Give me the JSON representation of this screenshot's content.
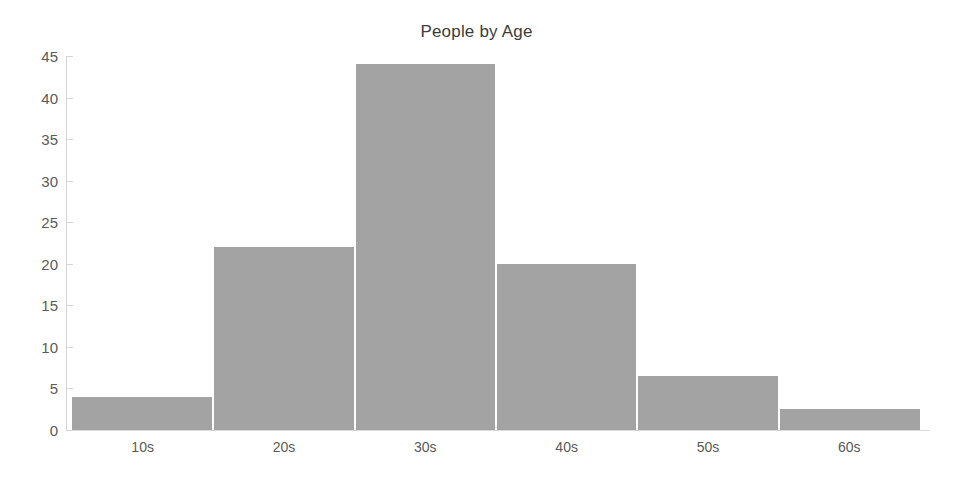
{
  "chart_data": {
    "type": "bar",
    "title": "People by Age",
    "xlabel": "",
    "ylabel": "",
    "categories": [
      "10s",
      "20s",
      "30s",
      "40s",
      "50s",
      "60s"
    ],
    "values": [
      4,
      22,
      44,
      20,
      6.5,
      2.5
    ],
    "ylim": [
      0,
      45
    ],
    "yticks": [
      0,
      5,
      10,
      15,
      20,
      25,
      30,
      35,
      40,
      45
    ],
    "ytick_labels": [
      "0",
      "5",
      "10",
      "15",
      "20",
      "25",
      "30",
      "35",
      "40",
      "45"
    ],
    "grid": false,
    "legend": null,
    "bar_color": "#a3a3a3",
    "bar_gap": "contiguous-histogram",
    "axis_color": "#d6d6d6",
    "text_color": "#5a5a5a",
    "title_color": "#3c3c3c",
    "background": "#ffffff"
  }
}
